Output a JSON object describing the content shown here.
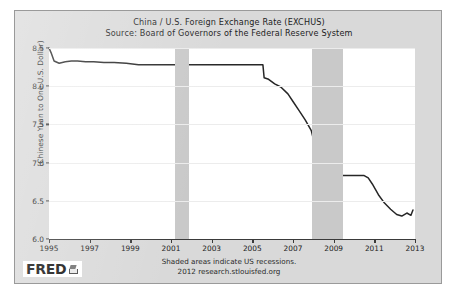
{
  "chart_data": {
    "type": "line",
    "title": "China / U.S. Foreign Exchange Rate (EXCHUS)",
    "subtitle": "Source: Board of Governors of the Federal Reserve System",
    "xlabel": "",
    "ylabel": "(Chinese Yuan to One U.S. Dollar)",
    "xlim": [
      1995,
      2013
    ],
    "ylim": [
      6.0,
      8.5
    ],
    "yticks": [
      "8.5",
      "8.0",
      "7.5",
      "7.0",
      "6.5",
      "6.0"
    ],
    "ytick_values": [
      8.5,
      8.0,
      7.5,
      7.0,
      6.5,
      6.0
    ],
    "xticks": [
      "1995",
      "1997",
      "1999",
      "2001",
      "2003",
      "2005",
      "2007",
      "2009",
      "2011",
      "2013"
    ],
    "xtick_values": [
      1995,
      1997,
      1999,
      2001,
      2003,
      2005,
      2007,
      2009,
      2011,
      2013
    ],
    "grid": true,
    "legend": "none",
    "line_color": "#262626",
    "band_color": "#c9c9c9",
    "recession_bands": [
      {
        "start": 2001.2,
        "end": 2001.9,
        "label": "2001 recession"
      },
      {
        "start": 2007.95,
        "end": 2009.45,
        "label": "2007-2009 recession"
      }
    ],
    "annotations": [
      "Shaded areas indicate US recessions.",
      "2012 research.stlouisfed.org"
    ],
    "series": [
      {
        "name": "EXCHUS",
        "x": [
          1995.0,
          1995.1,
          1995.25,
          1995.5,
          1995.8,
          1996.1,
          1996.4,
          1996.8,
          1997.2,
          1997.7,
          1998.2,
          1998.8,
          1999.4,
          2000.0,
          2000.6,
          2001.2,
          2001.8,
          2002.4,
          2003.0,
          2003.6,
          2004.2,
          2004.8,
          2005.3,
          2005.52,
          2005.58,
          2005.8,
          2006.1,
          2006.4,
          2006.75,
          2007.0,
          2007.3,
          2007.6,
          2007.9,
          2008.1,
          2008.3,
          2008.5,
          2008.7,
          2008.9,
          2009.2,
          2009.7,
          2010.2,
          2010.5,
          2010.7,
          2010.9,
          2011.2,
          2011.5,
          2011.8,
          2012.1,
          2012.35,
          2012.6,
          2012.8,
          2012.9
        ],
        "y": [
          8.5,
          8.44,
          8.33,
          8.3,
          8.32,
          8.33,
          8.33,
          8.32,
          8.32,
          8.31,
          8.31,
          8.3,
          8.28,
          8.28,
          8.28,
          8.28,
          8.28,
          8.28,
          8.28,
          8.28,
          8.28,
          8.28,
          8.28,
          8.28,
          8.11,
          8.09,
          8.03,
          7.99,
          7.9,
          7.8,
          7.68,
          7.56,
          7.42,
          7.2,
          7.0,
          6.9,
          6.85,
          6.83,
          6.83,
          6.83,
          6.83,
          6.83,
          6.8,
          6.72,
          6.58,
          6.47,
          6.39,
          6.32,
          6.3,
          6.34,
          6.31,
          6.38
        ]
      }
    ]
  },
  "logo": {
    "word": "FRED",
    "mark": "fred-swoosh-icon"
  }
}
